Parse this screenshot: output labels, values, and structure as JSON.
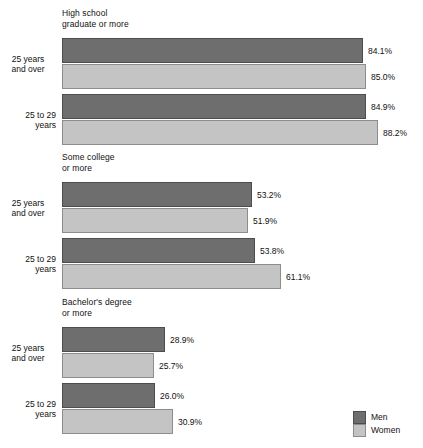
{
  "chart_data": {
    "type": "bar",
    "orientation": "horizontal",
    "title": "",
    "xlabel": "",
    "ylabel": "",
    "xlim": [
      0,
      100
    ],
    "grid": false,
    "value_suffix": "%",
    "legend": {
      "position": "bottom-right",
      "entries": [
        {
          "name": "Men",
          "color": "#6e6e6e"
        },
        {
          "name": "Women",
          "color": "#c4c4c4"
        }
      ]
    },
    "series": [
      {
        "name": "Men",
        "color": "#6e6e6e"
      },
      {
        "name": "Women",
        "color": "#c4c4c4"
      }
    ],
    "panels": [
      {
        "title": "High school\ngraduate or more",
        "groups": [
          {
            "category": "25 years\nand over",
            "align": "center",
            "bars": [
              {
                "series": "Men",
                "value": 84.1,
                "label": "84.1%"
              },
              {
                "series": "Women",
                "value": 85.0,
                "label": "85.0%"
              }
            ]
          },
          {
            "category": "25 to 29\nyears",
            "align": "right",
            "bars": [
              {
                "series": "Men",
                "value": 84.9,
                "label": "84.9%"
              },
              {
                "series": "Women",
                "value": 88.2,
                "label": "88.2%"
              }
            ]
          }
        ]
      },
      {
        "title": "Some college\nor more",
        "groups": [
          {
            "category": "25 years\nand over",
            "align": "center",
            "bars": [
              {
                "series": "Men",
                "value": 53.2,
                "label": "53.2%"
              },
              {
                "series": "Women",
                "value": 51.9,
                "label": "51.9%"
              }
            ]
          },
          {
            "category": "25 to 29\nyears",
            "align": "right",
            "bars": [
              {
                "series": "Men",
                "value": 53.8,
                "label": "53.8%"
              },
              {
                "series": "Women",
                "value": 61.1,
                "label": "61.1%"
              }
            ]
          }
        ]
      },
      {
        "title": "Bachelor's degree\nor more",
        "groups": [
          {
            "category": "25 years\nand over",
            "align": "center",
            "bars": [
              {
                "series": "Men",
                "value": 28.9,
                "label": "28.9%"
              },
              {
                "series": "Women",
                "value": 25.7,
                "label": "25.7%"
              }
            ]
          },
          {
            "category": "25 to 29\nyears",
            "align": "right",
            "bars": [
              {
                "series": "Men",
                "value": 26.0,
                "label": "26.0%"
              },
              {
                "series": "Women",
                "value": 30.9,
                "label": "30.9%"
              }
            ]
          }
        ]
      }
    ]
  },
  "layout": {
    "bar_origin_x": 62,
    "px_per_percent": 3.58,
    "panel_tops": [
      8,
      152,
      297
    ],
    "panel_title_height": 30,
    "group_height": 51,
    "group_gap": 5
  }
}
